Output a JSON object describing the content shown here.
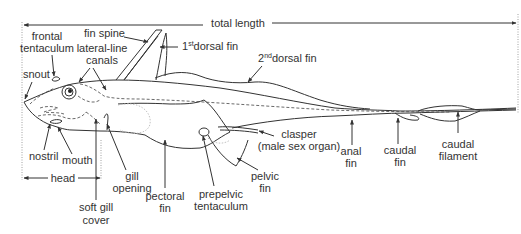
{
  "diagram": {
    "labels": {
      "total_length": "total length",
      "frontal_tentaculum_1": "frontal",
      "frontal_tentaculum_2": "tentaculum",
      "fin_spine": "fin spine",
      "first_dorsal_pre": "1",
      "first_dorsal_sup": "st",
      "first_dorsal_post": "dorsal fin",
      "lateral_line_1": "lateral-line",
      "lateral_line_2": "canals",
      "second_dorsal_pre": "2",
      "second_dorsal_sup": "nd",
      "second_dorsal_post": "dorsal fin",
      "snout": "snout",
      "nostril": "nostril",
      "mouth": "mouth",
      "head": "head",
      "gill_opening_1": "gill",
      "gill_opening_2": "opening",
      "soft_gill_cover_1": "soft gill",
      "soft_gill_cover_2": "cover",
      "pectoral_fin_1": "pectoral",
      "pectoral_fin_2": "fin",
      "prepelvic_1": "prepelvic",
      "prepelvic_2": "tentaculum",
      "pelvic_fin_1": "pelvic",
      "pelvic_fin_2": "fin",
      "clasper_1": "clasper",
      "clasper_2": "(male sex organ)",
      "anal_fin_1": "anal",
      "anal_fin_2": "fin",
      "caudal_fin_1": "caudal",
      "caudal_fin_2": "fin",
      "caudal_filament_1": "caudal",
      "caudal_filament_2": "filament"
    },
    "colors": {
      "line": "#333333",
      "text": "#333333",
      "background": "#ffffff"
    }
  }
}
